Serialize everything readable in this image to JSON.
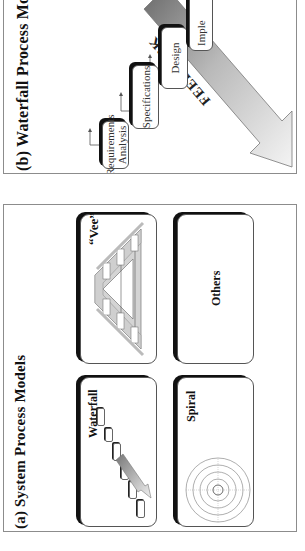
{
  "figure": {
    "orientation": "rotated -90deg (text reads bottom-to-top)",
    "panels": [
      {
        "id": "a",
        "title": "(a)  System Process Models",
        "cards": [
          {
            "label": "Waterfall",
            "thumbnail": "waterfall-diagram"
          },
          {
            "label": "“Vee”",
            "thumbnail": "vee-diagram"
          },
          {
            "label": "Spiral",
            "thumbnail": "spiral-diagram"
          },
          {
            "label": "Others",
            "thumbnail": ""
          }
        ]
      },
      {
        "id": "b",
        "title": "(b)  Waterfall Process Model",
        "steps": [
          {
            "label": "Requirements Analysis",
            "line1": "Requirements",
            "line2": "Analysis"
          },
          {
            "label": "Specifications"
          },
          {
            "label": "Design"
          },
          {
            "label": "Imple"
          }
        ],
        "feedback_label": "FEEDBACK"
      }
    ]
  },
  "colors": {
    "panel_border": "#8c8c8c",
    "card_shadow": "#111111",
    "feedback_dark": "#6e6e6e",
    "feedback_light": "#f2f2f2"
  }
}
